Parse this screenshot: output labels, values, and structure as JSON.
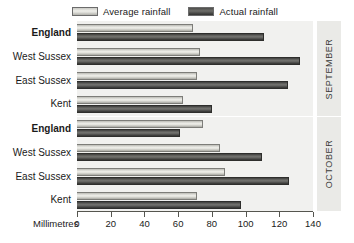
{
  "chart_data": {
    "type": "bar",
    "orientation": "horizontal",
    "title": "",
    "xlabel": "Millimetres",
    "ylabel": "",
    "xlim": [
      0,
      140
    ],
    "xticks": [
      0,
      20,
      40,
      60,
      80,
      100,
      120,
      140
    ],
    "xtick_labels": [
      "0",
      "20",
      "40",
      "60",
      "80",
      "100",
      "120",
      "140"
    ],
    "grid": false,
    "legend_position": "top",
    "legend": [
      "Average rainfall",
      "Actual rainfall"
    ],
    "series": [
      {
        "name": "Average rainfall",
        "key": "avg"
      },
      {
        "name": "Actual rainfall",
        "key": "actual"
      }
    ],
    "panels": [
      {
        "label": "SEPTEMBER",
        "categories": [
          "England",
          "West Sussex",
          "East Sussex",
          "Kent"
        ],
        "bold_categories": [
          "England"
        ],
        "rows": [
          {
            "category": "England",
            "avg": 69,
            "actual": 111
          },
          {
            "category": "West Sussex",
            "avg": 73,
            "actual": 132
          },
          {
            "category": "East Sussex",
            "avg": 71,
            "actual": 125
          },
          {
            "category": "Kent",
            "avg": 63,
            "actual": 80
          }
        ]
      },
      {
        "label": "OCTOBER",
        "categories": [
          "England",
          "West Sussex",
          "East Sussex",
          "Kent"
        ],
        "bold_categories": [
          "England"
        ],
        "rows": [
          {
            "category": "England",
            "avg": 75,
            "actual": 61
          },
          {
            "category": "West Sussex",
            "avg": 85,
            "actual": 110
          },
          {
            "category": "East Sussex",
            "avg": 88,
            "actual": 126
          },
          {
            "category": "Kent",
            "avg": 71,
            "actual": 97
          }
        ]
      }
    ],
    "colors": {
      "average_rainfall": "#dcdcd6",
      "actual_rainfall": "#5d5d5a",
      "plot_background": "#f1f1ef",
      "panel_background": "#eaeae7",
      "axis": "#55554f",
      "text": "#1a1a1a"
    }
  }
}
